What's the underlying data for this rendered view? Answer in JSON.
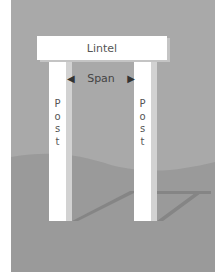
{
  "diagram": {
    "lintel_label": "Lintel",
    "span_label": "Span",
    "posts": [
      {
        "letters": [
          "P",
          "o",
          "s",
          "t"
        ]
      },
      {
        "letters": [
          "P",
          "o",
          "s",
          "t"
        ]
      }
    ],
    "arrow_left": "◀",
    "arrow_right": "▶"
  },
  "colors": {
    "sky": "#a9a9a9",
    "ground": "#9a9a9a",
    "shadow": "#858585",
    "structure": "#ffffff"
  }
}
